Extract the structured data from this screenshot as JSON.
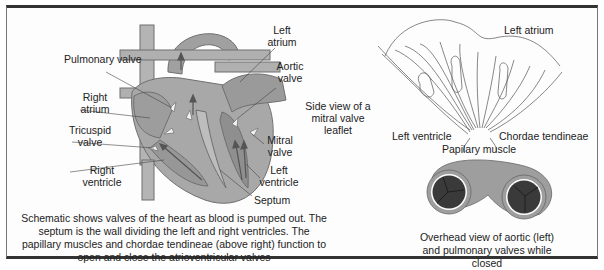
{
  "heart_schematic": {
    "labels": {
      "pulmonary_valve": "Pulmonary valve",
      "right_atrium": "Right atrium",
      "tricuspid_valve": "Tricuspid valve",
      "right_ventricle": "Right ventricle",
      "left_atrium": "Left atrium",
      "aortic_valve": "Aortic valve",
      "mitral_valve": "Mitral valve",
      "left_ventricle": "Left ventricle",
      "septum": "Septum"
    },
    "caption": "Schematic shows valves of the heart as blood is pumped out. The septum is the wall dividing the left and right ventricles. The papillary muscles and chordae tendineae (above right) function to open and close the atrioventricular valves"
  },
  "mitral_side_view": {
    "title": "Side view of a mitral valve leaflet",
    "labels": {
      "left_atrium": "Left atrium",
      "left_ventricle": "Left ventricle",
      "chordae_tendineae": "Chordae tendineae",
      "papillary_muscle": "Papilary muscle"
    }
  },
  "overhead_view": {
    "caption": "Overhead view of aortic (left) and pulmonary valves while closed"
  },
  "colors": {
    "heart_fill": "#a9a9a9",
    "heart_dark": "#8a8a8a",
    "valve_dark": "#3a3a3a",
    "border": "#333333"
  }
}
